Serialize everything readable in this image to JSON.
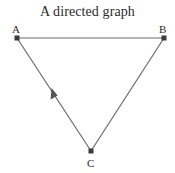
{
  "title": "A directed graph",
  "nodes": [
    {
      "id": "A",
      "label": "A",
      "x": 17,
      "y": 38,
      "label_x": 13,
      "label_y": 32
    },
    {
      "id": "B",
      "label": "B",
      "x": 164,
      "y": 38,
      "label_x": 160,
      "label_y": 32
    },
    {
      "id": "C",
      "label": "C",
      "x": 91,
      "y": 151,
      "label_x": 87,
      "label_y": 167
    }
  ],
  "edges": [
    {
      "from": "A",
      "to": "B",
      "directed": false
    },
    {
      "from": "B",
      "to": "C",
      "directed": false
    },
    {
      "from": "C",
      "to": "A",
      "directed": true,
      "arrow_position": {
        "x": 54,
        "y": 92
      }
    }
  ],
  "colors": {
    "edge": "#6b6b6b",
    "node": "#3a3a3a",
    "text": "#2b2b2b",
    "background": "#ffffff"
  }
}
